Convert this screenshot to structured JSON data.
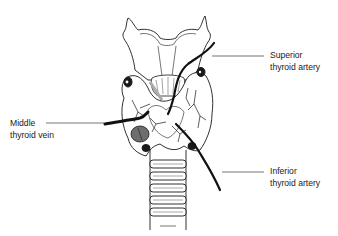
{
  "figure": {
    "colors": {
      "line": "#1a1a1a",
      "fill": "#ffffff",
      "gland_shade": "#6e6e6e",
      "vessel": "#111111"
    }
  },
  "labels": {
    "superior": {
      "line1": "Superior",
      "line2": "thyroid artery"
    },
    "middle": {
      "line1": "Middle",
      "line2": "thyroid vein"
    },
    "inferior": {
      "line1": "Inferior",
      "line2": "thyroid artery"
    }
  }
}
